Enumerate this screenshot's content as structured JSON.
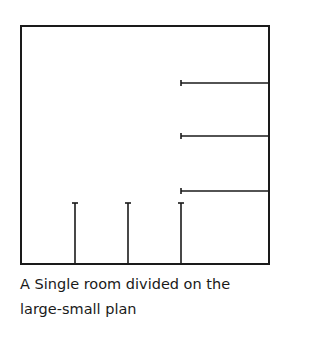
{
  "diagram": {
    "stroke_color": "#1a1a1a",
    "room": {
      "x1": 21,
      "y1": 26,
      "x2": 269,
      "y2": 264
    },
    "horizontal_partitions": [
      {
        "x1": 181,
        "x2": 269,
        "y": 83
      },
      {
        "x1": 181,
        "x2": 269,
        "y": 136
      },
      {
        "x1": 181,
        "x2": 269,
        "y": 191
      }
    ],
    "vertical_partitions": [
      {
        "x": 75,
        "y1": 203,
        "y2": 264
      },
      {
        "x": 128,
        "y1": 203,
        "y2": 264
      },
      {
        "x": 181,
        "y1": 203,
        "y2": 264
      }
    ]
  },
  "caption": {
    "line1": "A Single room divided on the",
    "line2": "large-small plan"
  }
}
